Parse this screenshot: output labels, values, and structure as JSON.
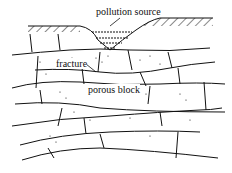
{
  "diagram": {
    "type": "cross-section",
    "labels": {
      "pollution_source": "pollution source",
      "fracture": "fracture",
      "porous_block": "porous block"
    },
    "colors": {
      "line": "#111111",
      "background": "#ffffff"
    }
  }
}
